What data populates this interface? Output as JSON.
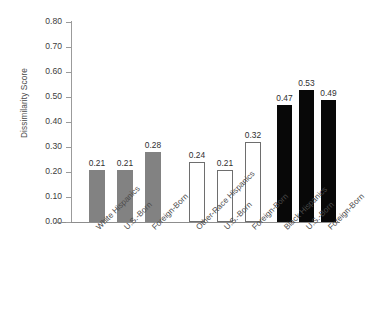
{
  "chart_data": {
    "type": "bar",
    "title": "",
    "xlabel": "",
    "ylabel": "Dissimilarity Score",
    "ylim": [
      0.0,
      0.8
    ],
    "grid": false,
    "legend": null,
    "ytick_labels": [
      "0.80",
      "0.70",
      "0.60",
      "0.50",
      "0.40",
      "0.30",
      "0.20",
      "0.10",
      "0.00"
    ],
    "ytick_values": [
      0.8,
      0.7,
      0.6,
      0.5,
      0.4,
      0.3,
      0.2,
      0.1,
      0.0
    ],
    "categories": [
      "White Hispanics",
      "U.S.-Born",
      "Foreign-Born",
      "Other-Race Hispanics",
      "U.S.-Born",
      "Foreign-Born",
      "Black Hispanics",
      "U.S.-Born",
      "Foreign-Born"
    ],
    "values": [
      0.21,
      0.21,
      0.28,
      0.24,
      0.21,
      0.32,
      0.47,
      0.53,
      0.49
    ],
    "value_labels": [
      "0.21",
      "0.21",
      "0.28",
      "0.24",
      "0.21",
      "0.32",
      "0.47",
      "0.53",
      "0.49"
    ],
    "groups": [
      {
        "name": "White Hispanics",
        "style": "gray",
        "fill": "#828282",
        "categories": [
          "White Hispanics",
          "U.S.-Born",
          "Foreign-Born"
        ],
        "values": [
          0.21,
          0.21,
          0.28
        ]
      },
      {
        "name": "Other-Race Hispanics",
        "style": "white",
        "fill": "#ffffff",
        "categories": [
          "Other-Race Hispanics",
          "U.S.-Born",
          "Foreign-Born"
        ],
        "values": [
          0.24,
          0.21,
          0.32
        ]
      },
      {
        "name": "Black Hispanics",
        "style": "black",
        "fill": "#080808",
        "categories": [
          "Black Hispanics",
          "U.S.-Born",
          "Foreign-Born"
        ],
        "values": [
          0.47,
          0.53,
          0.49
        ]
      }
    ],
    "colors": {
      "gray_bar": "#828282",
      "white_bar": "#ffffff",
      "black_bar": "#080808",
      "axis": "#8d8d8d",
      "text": "#3a3a3a",
      "background": "#ffffff"
    }
  }
}
